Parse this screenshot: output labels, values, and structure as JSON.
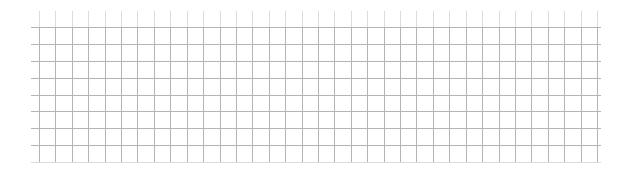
{
  "canvas": {
    "width": 631,
    "height": 171,
    "background": "#ffffff"
  },
  "grid": {
    "line_color": "#b4b4b4",
    "faint_line_color": "#dcdcdc",
    "line_width": 1,
    "vertical_lines": {
      "count": 35,
      "x_start": 39,
      "x_end": 597,
      "y_top": 11,
      "y_bottom": 162
    },
    "horizontal_lines": {
      "count": 9,
      "y_start": 27,
      "y_end": 162,
      "x_left": 31,
      "x_right": 601
    }
  }
}
